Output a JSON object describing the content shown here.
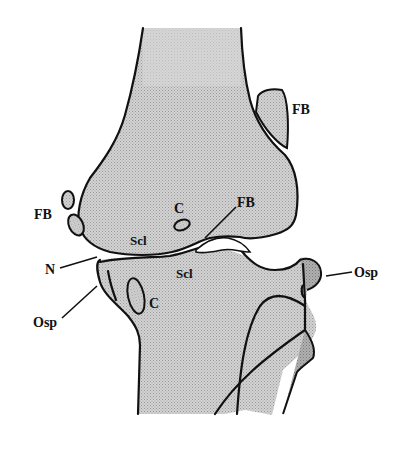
{
  "figure": {
    "colors": {
      "bone_fill": "#c9c9c9",
      "osteophyte_fill": "#a8a8a8",
      "outline": "#111111",
      "background": "#ffffff"
    },
    "labels": {
      "fb_upper_right": "FB",
      "fb_left": "FB",
      "fb_joint": "FB",
      "c_femur": "C",
      "c_tibia": "C",
      "scl_femur": "Scl",
      "scl_tibia": "Scl",
      "n": "N",
      "osp_left": "Osp",
      "osp_right": "Osp"
    }
  }
}
